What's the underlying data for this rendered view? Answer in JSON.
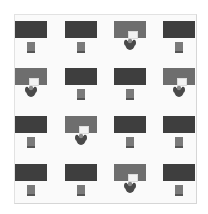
{
  "layout": {
    "rows": 4,
    "columns": 4
  },
  "colors": {
    "empty_desk": "#3e3e3e",
    "occupied_desk": "#6e6e6e",
    "chair": "#7a7a7a",
    "person": "#4a4a4a",
    "room_background": "#fafafa"
  },
  "desks": [
    {
      "row": 0,
      "col": 0,
      "status": "empty",
      "icon": "chair-icon"
    },
    {
      "row": 0,
      "col": 1,
      "status": "empty",
      "icon": "chair-icon"
    },
    {
      "row": 0,
      "col": 2,
      "status": "occupied",
      "icon": "person-at-computer-icon"
    },
    {
      "row": 0,
      "col": 3,
      "status": "empty",
      "icon": "chair-icon"
    },
    {
      "row": 1,
      "col": 0,
      "status": "occupied",
      "icon": "person-at-computer-icon"
    },
    {
      "row": 1,
      "col": 1,
      "status": "empty",
      "icon": "chair-icon"
    },
    {
      "row": 1,
      "col": 2,
      "status": "empty",
      "icon": "chair-icon"
    },
    {
      "row": 1,
      "col": 3,
      "status": "occupied",
      "icon": "person-at-computer-icon"
    },
    {
      "row": 2,
      "col": 0,
      "status": "empty",
      "icon": "chair-icon"
    },
    {
      "row": 2,
      "col": 1,
      "status": "occupied",
      "icon": "person-at-computer-icon"
    },
    {
      "row": 2,
      "col": 2,
      "status": "empty",
      "icon": "chair-icon"
    },
    {
      "row": 2,
      "col": 3,
      "status": "empty",
      "icon": "chair-icon"
    },
    {
      "row": 3,
      "col": 0,
      "status": "empty",
      "icon": "chair-icon"
    },
    {
      "row": 3,
      "col": 1,
      "status": "empty",
      "icon": "chair-icon"
    },
    {
      "row": 3,
      "col": 2,
      "status": "occupied",
      "icon": "person-at-computer-icon"
    },
    {
      "row": 3,
      "col": 3,
      "status": "empty",
      "icon": "chair-icon"
    }
  ]
}
